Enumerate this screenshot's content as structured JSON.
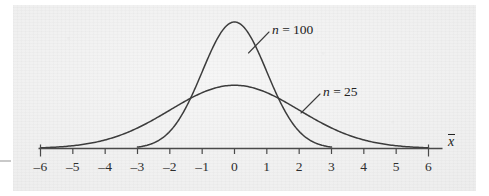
{
  "figure": {
    "background_color": "#f1f1f1",
    "curve_color": "#3c3c3c",
    "axis_color": "#4a4a4a",
    "axis_variable_label": "x",
    "axis_variable_has_overbar": true
  },
  "chart_data": {
    "type": "line",
    "title": "",
    "subtitle": "",
    "xlabel": "x̄",
    "ylabel": "",
    "xlim": [
      -6,
      6
    ],
    "ylim": [
      0,
      1
    ],
    "grid": false,
    "legend_position": "inline-annotation",
    "x_ticks": [
      -6,
      -5,
      -4,
      -3,
      -2,
      -1,
      0,
      1,
      2,
      3,
      4,
      5,
      6
    ],
    "x_tick_labels": [
      "–6",
      "–5",
      "–4",
      "–3",
      "–2",
      "–1",
      "0",
      "1",
      "2",
      "3",
      "4",
      "5",
      "6"
    ],
    "y_ticks": [],
    "y_tick_labels": [],
    "series": [
      {
        "name": "n = 100",
        "label": "n = 100",
        "label_prefix": "n",
        "label_suffix": "= 100",
        "distribution": "normal",
        "mean": 0,
        "sigma": 1.0,
        "peak_height": 1.0,
        "x_start": -3,
        "x_end": 3,
        "color": "#3c3c3c"
      },
      {
        "name": "n = 25",
        "label": "n = 25",
        "label_prefix": "n",
        "label_suffix": "= 25",
        "distribution": "normal",
        "mean": 0,
        "sigma": 2.0,
        "peak_height": 0.5,
        "x_start": -6,
        "x_end": 6,
        "color": "#3c3c3c"
      }
    ],
    "annotations": [
      {
        "text": "n = 100",
        "target_series": "n = 100",
        "x": 1.3,
        "y": 0.86
      },
      {
        "text": "n = 25",
        "target_series": "n = 25",
        "x": 3.0,
        "y": 0.44
      }
    ]
  }
}
